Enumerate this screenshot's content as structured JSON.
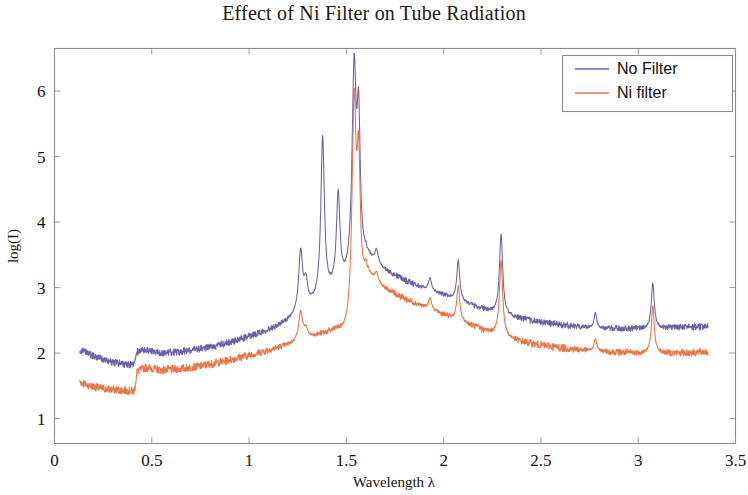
{
  "chart_data": {
    "type": "line",
    "title": "Effect of Ni Filter on Tube Radiation",
    "xlabel": "Wavelength λ",
    "ylabel": "log(I)",
    "xlim": [
      0,
      3.5
    ],
    "ylim": [
      0.62,
      6.65
    ],
    "xticks": [
      0,
      0.5,
      1,
      1.5,
      2,
      2.5,
      3,
      3.5
    ],
    "xticklabels": [
      "0",
      "0.5",
      "1",
      "1.5",
      "2",
      "2.5",
      "3",
      "3.5"
    ],
    "yticks": [
      1,
      2,
      3,
      4,
      5,
      6
    ],
    "yticklabels": [
      "1",
      "2",
      "3",
      "4",
      "5",
      "6"
    ],
    "grid": false,
    "legend_position": "top-right",
    "colors": {
      "no_filter": "#6b61ab",
      "ni_filter": "#ea7443",
      "frame": "#8a8a8a",
      "text": "#111111",
      "background": "#ffffff"
    },
    "series": [
      {
        "name": "No  Filter",
        "color": "#6b61ab",
        "x_start": 0.13,
        "x_end": 3.36,
        "noise_amplitude": 0.055,
        "baseline_points": [
          [
            0.13,
            2.05
          ],
          [
            0.18,
            1.98
          ],
          [
            0.24,
            1.91
          ],
          [
            0.3,
            1.86
          ],
          [
            0.36,
            1.83
          ],
          [
            0.41,
            1.82
          ],
          [
            0.425,
            2.02
          ],
          [
            0.47,
            2.05
          ],
          [
            0.55,
            2.0
          ],
          [
            0.65,
            2.02
          ],
          [
            0.75,
            2.06
          ],
          [
            0.85,
            2.12
          ],
          [
            0.95,
            2.2
          ],
          [
            1.05,
            2.3
          ],
          [
            1.15,
            2.41
          ],
          [
            1.2,
            2.48
          ],
          [
            1.25,
            2.57
          ],
          [
            1.3,
            2.66
          ],
          [
            1.35,
            2.76
          ],
          [
            1.4,
            2.86
          ],
          [
            1.45,
            2.94
          ],
          [
            1.5,
            3.0
          ],
          [
            1.55,
            3.05
          ],
          [
            1.6,
            3.4
          ],
          [
            1.65,
            3.33
          ],
          [
            1.7,
            3.24
          ],
          [
            1.8,
            3.1
          ],
          [
            1.9,
            2.98
          ],
          [
            2.0,
            2.88
          ],
          [
            2.1,
            2.77
          ],
          [
            2.2,
            2.67
          ],
          [
            2.3,
            2.58
          ],
          [
            2.4,
            2.52
          ],
          [
            2.5,
            2.47
          ],
          [
            2.6,
            2.43
          ],
          [
            2.7,
            2.4
          ],
          [
            2.8,
            2.38
          ],
          [
            2.9,
            2.37
          ],
          [
            3.0,
            2.37
          ],
          [
            3.1,
            2.38
          ],
          [
            3.2,
            2.39
          ],
          [
            3.3,
            2.4
          ],
          [
            3.36,
            2.41
          ]
        ],
        "peaks": [
          {
            "center": 1.265,
            "height": 3.52,
            "width": 0.012,
            "label": "peak-1.27"
          },
          {
            "center": 1.292,
            "height": 3.02,
            "width": 0.011,
            "label": "peak-1.29"
          },
          {
            "center": 1.378,
            "height": 5.25,
            "width": 0.011,
            "label": "peak-1.38"
          },
          {
            "center": 1.458,
            "height": 4.35,
            "width": 0.011,
            "label": "peak-1.46"
          },
          {
            "center": 1.54,
            "height": 6.2,
            "width": 0.013,
            "label": "peak-1.54-kalpha"
          },
          {
            "center": 1.563,
            "height": 5.25,
            "width": 0.01,
            "label": "peak-1.56"
          },
          {
            "center": 1.655,
            "height": 3.52,
            "width": 0.01,
            "label": "peak-1.66"
          },
          {
            "center": 1.93,
            "height": 3.15,
            "width": 0.009,
            "label": "peak-1.93"
          },
          {
            "center": 2.075,
            "height": 3.42,
            "width": 0.009,
            "label": "peak-2.08"
          },
          {
            "center": 2.295,
            "height": 3.81,
            "width": 0.01,
            "label": "peak-2.29"
          },
          {
            "center": 2.78,
            "height": 2.62,
            "width": 0.008,
            "label": "peak-2.78"
          },
          {
            "center": 3.075,
            "height": 3.07,
            "width": 0.009,
            "label": "peak-3.08"
          }
        ]
      },
      {
        "name": "Ni  filter",
        "color": "#ea7443",
        "x_start": 0.13,
        "x_end": 3.36,
        "noise_amplitude": 0.062,
        "baseline_points": [
          [
            0.13,
            1.56
          ],
          [
            0.18,
            1.5
          ],
          [
            0.24,
            1.46
          ],
          [
            0.3,
            1.44
          ],
          [
            0.36,
            1.43
          ],
          [
            0.41,
            1.42
          ],
          [
            0.425,
            1.72
          ],
          [
            0.47,
            1.78
          ],
          [
            0.55,
            1.74
          ],
          [
            0.65,
            1.76
          ],
          [
            0.75,
            1.8
          ],
          [
            0.85,
            1.86
          ],
          [
            0.95,
            1.93
          ],
          [
            1.05,
            2.0
          ],
          [
            1.15,
            2.08
          ],
          [
            1.2,
            2.12
          ],
          [
            1.25,
            2.17
          ],
          [
            1.3,
            2.22
          ],
          [
            1.35,
            2.26
          ],
          [
            1.4,
            2.29
          ],
          [
            1.45,
            2.31
          ],
          [
            1.48,
            2.26
          ],
          [
            1.5,
            2.23
          ],
          [
            1.52,
            2.25
          ],
          [
            1.55,
            2.3
          ],
          [
            1.6,
            3.13
          ],
          [
            1.65,
            3.05
          ],
          [
            1.7,
            2.96
          ],
          [
            1.8,
            2.82
          ],
          [
            1.9,
            2.7
          ],
          [
            2.0,
            2.58
          ],
          [
            2.1,
            2.47
          ],
          [
            2.2,
            2.35
          ],
          [
            2.3,
            2.25
          ],
          [
            2.4,
            2.17
          ],
          [
            2.5,
            2.12
          ],
          [
            2.6,
            2.08
          ],
          [
            2.7,
            2.05
          ],
          [
            2.8,
            2.03
          ],
          [
            2.9,
            2.01
          ],
          [
            3.0,
            2.0
          ],
          [
            3.1,
            2.0
          ],
          [
            3.2,
            2.0
          ],
          [
            3.3,
            2.01
          ],
          [
            3.36,
            2.02
          ]
        ],
        "peaks": [
          {
            "center": 1.265,
            "height": 2.62,
            "width": 0.012,
            "label": "peak-1.27"
          },
          {
            "center": 1.292,
            "height": 2.34,
            "width": 0.011,
            "label": "peak-1.29"
          },
          {
            "center": 1.54,
            "height": 5.72,
            "width": 0.013,
            "label": "peak-1.54-kalpha"
          },
          {
            "center": 1.563,
            "height": 4.55,
            "width": 0.01,
            "label": "peak-1.56"
          },
          {
            "center": 1.655,
            "height": 3.18,
            "width": 0.01,
            "label": "peak-1.66"
          },
          {
            "center": 1.93,
            "height": 2.84,
            "width": 0.009,
            "label": "peak-1.93"
          },
          {
            "center": 2.075,
            "height": 3.02,
            "width": 0.009,
            "label": "peak-2.08"
          },
          {
            "center": 2.295,
            "height": 3.42,
            "width": 0.01,
            "label": "peak-2.29"
          },
          {
            "center": 2.78,
            "height": 2.22,
            "width": 0.008,
            "label": "peak-2.78"
          },
          {
            "center": 3.075,
            "height": 2.72,
            "width": 0.009,
            "label": "peak-3.08"
          }
        ]
      }
    ],
    "legend": [
      {
        "label": "No  Filter",
        "color": "#6b61ab"
      },
      {
        "label": "Ni  filter",
        "color": "#ea7443"
      }
    ]
  }
}
